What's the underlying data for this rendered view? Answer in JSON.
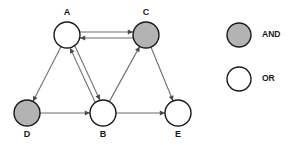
{
  "diagram": {
    "colors": {
      "and_fill": "#b3b3b3",
      "or_fill": "#ffffff",
      "node_stroke": "#1a1a1a",
      "edge": "#6e6e6e",
      "background": "#ffffff"
    },
    "nodes": [
      {
        "id": "A",
        "label": "A",
        "type": "OR",
        "fill": "#ffffff",
        "cx": 67,
        "cy": 35,
        "r": 13,
        "label_x": 67,
        "label_y": 13
      },
      {
        "id": "C",
        "label": "C",
        "type": "AND",
        "fill": "#b3b3b3",
        "cx": 146,
        "cy": 35,
        "r": 13,
        "label_x": 146,
        "label_y": 13
      },
      {
        "id": "D",
        "label": "D",
        "type": "AND",
        "fill": "#b3b3b3",
        "cx": 27,
        "cy": 113,
        "r": 13,
        "label_x": 27,
        "label_y": 135
      },
      {
        "id": "B",
        "label": "B",
        "type": "OR",
        "fill": "#ffffff",
        "cx": 103,
        "cy": 113,
        "r": 13,
        "label_x": 103,
        "label_y": 135
      },
      {
        "id": "E",
        "label": "E",
        "type": "OR",
        "fill": "#ffffff",
        "cx": 178,
        "cy": 113,
        "r": 13,
        "label_x": 178,
        "label_y": 135
      }
    ],
    "edges": [
      {
        "from": "A",
        "to": "C",
        "bidirectional": true,
        "offset": -3.0,
        "name": "edge-a-c"
      },
      {
        "from": "A",
        "to": "B",
        "bidirectional": true,
        "offset": -2.6,
        "name": "edge-a-b"
      },
      {
        "from": "A",
        "to": "D",
        "bidirectional": false,
        "offset": 0,
        "name": "edge-a-d"
      },
      {
        "from": "D",
        "to": "B",
        "bidirectional": false,
        "offset": 0,
        "name": "edge-d-b"
      },
      {
        "from": "B",
        "to": "C",
        "bidirectional": false,
        "offset": 0,
        "name": "edge-b-c"
      },
      {
        "from": "B",
        "to": "E",
        "bidirectional": false,
        "offset": 0,
        "name": "edge-b-e"
      },
      {
        "from": "C",
        "to": "E",
        "bidirectional": false,
        "offset": 0,
        "name": "edge-c-e"
      }
    ]
  },
  "legend": {
    "items": [
      {
        "label": "AND",
        "type": "AND",
        "fill": "#b3b3b3",
        "cx": 239,
        "cy": 35,
        "r": 12,
        "label_x": 262,
        "label_y": 35
      },
      {
        "label": "OR",
        "type": "OR",
        "fill": "#ffffff",
        "cx": 239,
        "cy": 79,
        "r": 12,
        "label_x": 262,
        "label_y": 79
      }
    ]
  }
}
